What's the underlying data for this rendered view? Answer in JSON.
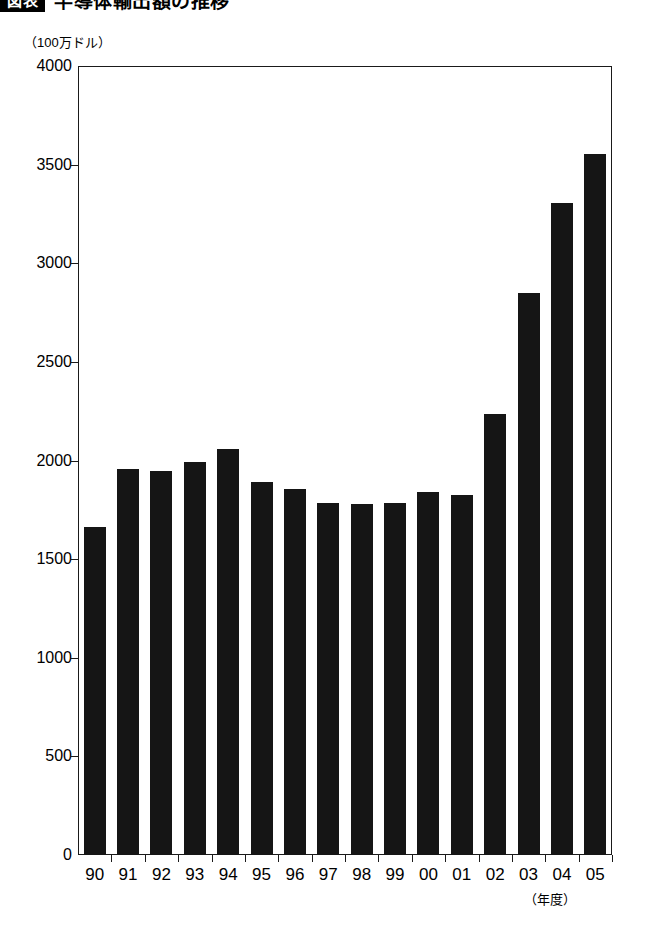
{
  "title": {
    "badge": "図表",
    "text": "半導体輸出額の推移"
  },
  "chart_data": {
    "type": "bar",
    "title": "半導体輸出額の推移",
    "xlabel": "（年度）",
    "ylabel": "（100万ドル）",
    "categories": [
      "90",
      "91",
      "92",
      "93",
      "94",
      "95",
      "96",
      "97",
      "98",
      "99",
      "00",
      "01",
      "02",
      "03",
      "04",
      "05"
    ],
    "values": [
      1663,
      1955,
      1945,
      1993,
      2058,
      1890,
      1855,
      1783,
      1778,
      1783,
      1840,
      1824,
      2237,
      2848,
      3305,
      3556
    ],
    "ylim": [
      0,
      4000
    ],
    "yticks": [
      0,
      500,
      1000,
      1500,
      2000,
      2500,
      3000,
      3500,
      4000
    ],
    "ytick_labels": [
      "0",
      "500",
      "1000",
      "1500",
      "2000",
      "2500",
      "3000",
      "3500",
      "4000"
    ],
    "grid": false,
    "legend": "none",
    "bar_color": "#151515"
  }
}
